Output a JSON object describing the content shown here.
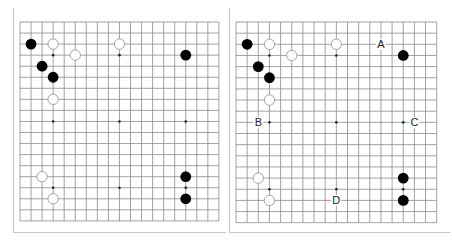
{
  "boards": [
    {
      "id": "left",
      "size": 19,
      "stones": [
        {
          "color": "black",
          "col": 1,
          "row": 2
        },
        {
          "color": "white",
          "col": 3,
          "row": 2
        },
        {
          "color": "white",
          "col": 5,
          "row": 3
        },
        {
          "color": "white",
          "col": 9,
          "row": 2
        },
        {
          "color": "black",
          "col": 15,
          "row": 3
        },
        {
          "color": "black",
          "col": 2,
          "row": 4
        },
        {
          "color": "black",
          "col": 3,
          "row": 5
        },
        {
          "color": "white",
          "col": 3,
          "row": 7
        },
        {
          "color": "white",
          "col": 2,
          "row": 14
        },
        {
          "color": "white",
          "col": 3,
          "row": 16
        },
        {
          "color": "black",
          "col": 15,
          "row": 14
        },
        {
          "color": "black",
          "col": 15,
          "row": 16
        }
      ],
      "labels": []
    },
    {
      "id": "right",
      "size": 19,
      "stones": [
        {
          "color": "black",
          "col": 1,
          "row": 2
        },
        {
          "color": "white",
          "col": 3,
          "row": 2
        },
        {
          "color": "white",
          "col": 5,
          "row": 3
        },
        {
          "color": "white",
          "col": 9,
          "row": 2
        },
        {
          "color": "black",
          "col": 15,
          "row": 3
        },
        {
          "color": "black",
          "col": 2,
          "row": 4
        },
        {
          "color": "black",
          "col": 3,
          "row": 5
        },
        {
          "color": "white",
          "col": 3,
          "row": 7
        },
        {
          "color": "white",
          "col": 2,
          "row": 14
        },
        {
          "color": "white",
          "col": 3,
          "row": 16
        },
        {
          "color": "black",
          "col": 15,
          "row": 14
        },
        {
          "color": "black",
          "col": 15,
          "row": 16
        }
      ],
      "labels": [
        {
          "text": "A",
          "col": 13,
          "row": 2
        },
        {
          "text": "B",
          "col": 2,
          "row": 9
        },
        {
          "text": "C",
          "col": 16,
          "row": 9
        },
        {
          "text": "D",
          "col": 9,
          "row": 16
        }
      ]
    }
  ],
  "star_points": [
    [
      3,
      3
    ],
    [
      9,
      3
    ],
    [
      15,
      3
    ],
    [
      3,
      9
    ],
    [
      9,
      9
    ],
    [
      15,
      9
    ],
    [
      3,
      15
    ],
    [
      9,
      15
    ],
    [
      15,
      15
    ]
  ],
  "colors": {
    "grid_line": "#8a8a8a",
    "frame_line": "#c8c8c8",
    "black_stone": "#000000",
    "white_stone_fill": "#ffffff",
    "white_stone_stroke": "#9a9a9a",
    "label_text": "#222222"
  }
}
